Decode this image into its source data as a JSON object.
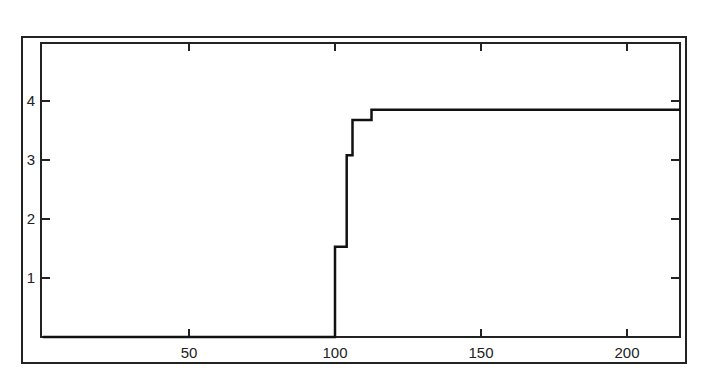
{
  "chart_data": {
    "type": "line",
    "subtype": "step",
    "title": "",
    "xlabel": "",
    "ylabel": "",
    "xlim": [
      0,
      222
    ],
    "ylim": [
      0,
      4.9
    ],
    "grid": false,
    "legend": null,
    "x_ticks": [
      50,
      100,
      150,
      200
    ],
    "x_tick_labels": [
      "50",
      "100",
      "150",
      "200"
    ],
    "y_ticks": [
      1,
      2,
      3,
      4
    ],
    "y_tick_labels": [
      "1",
      "2",
      "3",
      "4"
    ],
    "series": [
      {
        "name": "step",
        "color": "#111111",
        "x": [
          0,
          100,
          100,
          104,
          104,
          106,
          106,
          112.5,
          112.5,
          222
        ],
        "y": [
          0,
          0,
          1.53,
          1.53,
          3.08,
          3.08,
          3.68,
          3.68,
          3.85,
          3.85
        ]
      }
    ]
  },
  "axes": {
    "x_labels": [
      "50",
      "100",
      "150",
      "200"
    ],
    "y_labels": [
      "4",
      "3",
      "2",
      "1"
    ]
  }
}
